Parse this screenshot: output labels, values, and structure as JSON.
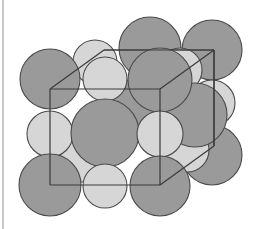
{
  "diagram": {
    "type": "crystal-lattice",
    "title": "",
    "structure": "rock-salt cubic unit cell",
    "colors": {
      "large_ion": "#9a9a9a",
      "small_ion": "#d6d6d6",
      "outline": "#4a4a4a",
      "cube_edge": "#3a3a3a",
      "background": "#ffffff"
    },
    "cube": {
      "front": {
        "x1": 50,
        "y1": 89,
        "x2": 160,
        "y2": 185
      },
      "back_offset": {
        "dx": 54,
        "dy": -39
      }
    },
    "spheres_back": [
      {
        "kind": "large",
        "cx": 150,
        "cy": 48,
        "r": 31
      },
      {
        "kind": "large",
        "cx": 212,
        "cy": 50,
        "r": 30
      },
      {
        "kind": "small",
        "cx": 95,
        "cy": 62,
        "r": 22
      },
      {
        "kind": "small",
        "cx": 180,
        "cy": 70,
        "r": 22
      },
      {
        "kind": "small",
        "cx": 212,
        "cy": 103,
        "r": 23
      },
      {
        "kind": "large",
        "cx": 212,
        "cy": 155,
        "r": 30
      },
      {
        "kind": "small",
        "cx": 187,
        "cy": 150,
        "r": 22
      },
      {
        "kind": "large",
        "cx": 195,
        "cy": 115,
        "r": 32
      },
      {
        "kind": "small",
        "cx": 82,
        "cy": 160,
        "r": 22
      },
      {
        "kind": "large",
        "cx": 130,
        "cy": 110,
        "r": 30
      }
    ],
    "spheres_front": [
      {
        "kind": "large",
        "cx": 50,
        "cy": 79,
        "r": 30
      },
      {
        "kind": "small",
        "cx": 105,
        "cy": 79,
        "r": 22
      },
      {
        "kind": "large",
        "cx": 160,
        "cy": 80,
        "r": 32
      },
      {
        "kind": "small",
        "cx": 50,
        "cy": 134,
        "r": 23
      },
      {
        "kind": "large",
        "cx": 105,
        "cy": 133,
        "r": 34
      },
      {
        "kind": "small",
        "cx": 160,
        "cy": 134,
        "r": 23
      },
      {
        "kind": "large",
        "cx": 50,
        "cy": 185,
        "r": 31
      },
      {
        "kind": "small",
        "cx": 105,
        "cy": 186,
        "r": 22
      },
      {
        "kind": "large",
        "cx": 160,
        "cy": 186,
        "r": 30
      }
    ]
  }
}
